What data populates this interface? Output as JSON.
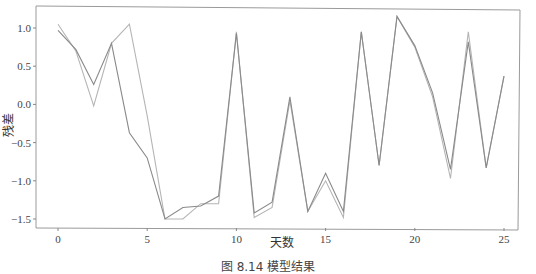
{
  "chart_data": {
    "type": "line",
    "title": "",
    "xlabel": "天数",
    "ylabel": "残差",
    "x": [
      0,
      1,
      2,
      3,
      4,
      5,
      6,
      7,
      8,
      9,
      10,
      11,
      12,
      13,
      14,
      15,
      16,
      17,
      18,
      19,
      20,
      21,
      22,
      23,
      24,
      25
    ],
    "series": [
      {
        "name": "series-dark",
        "color": "#8a8a8a",
        "values": [
          0.97,
          0.72,
          0.26,
          0.8,
          -0.37,
          -0.7,
          -1.5,
          -1.35,
          -1.33,
          -1.2,
          0.93,
          -1.42,
          -1.28,
          0.1,
          -1.4,
          -0.9,
          -1.4,
          0.95,
          -0.8,
          1.15,
          0.77,
          0.15,
          -0.85,
          0.82,
          -0.83,
          0.37
        ]
      },
      {
        "name": "series-light",
        "color": "#b5b5b5",
        "values": [
          1.05,
          0.7,
          -0.02,
          0.8,
          1.05,
          -0.15,
          -1.5,
          -1.5,
          -1.3,
          -1.3,
          0.95,
          -1.48,
          -1.35,
          0.05,
          -1.4,
          -1.0,
          -1.48,
          0.95,
          -0.8,
          1.15,
          0.75,
          0.1,
          -0.97,
          0.95,
          -0.83,
          0.37
        ]
      }
    ],
    "xticks": [
      0,
      5,
      10,
      15,
      20,
      25
    ],
    "yticks": [
      1.0,
      0.5,
      0.0,
      -0.5,
      -1.0,
      -1.5
    ],
    "ytick_labels": [
      "1.0",
      "0.5",
      "0.0",
      "−0.5",
      "−1.0",
      "−1.5"
    ],
    "xlim": [
      -1.2,
      26.5
    ],
    "ylim": [
      -1.62,
      1.3
    ],
    "grid": false,
    "legend": null
  },
  "caption": "图 8.14  模型结果"
}
